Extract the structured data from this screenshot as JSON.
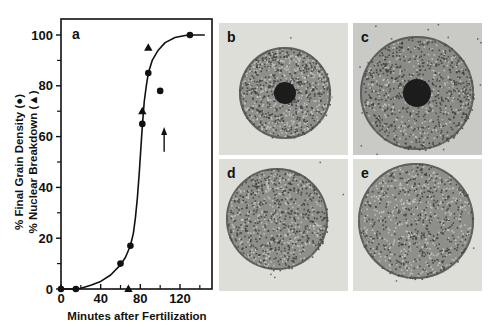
{
  "chart_data": {
    "type": "scatter",
    "panel_label": "a",
    "title": "",
    "xlabel": "Minutes after Fertilization",
    "ylabel_lines": [
      "% Final Grain Density (●)",
      "% Nuclear Breakdown (▲)"
    ],
    "xlim": [
      0,
      145
    ],
    "ylim": [
      0,
      100
    ],
    "xticks": [
      0,
      40,
      80,
      120
    ],
    "xtick_minor": [
      20,
      60,
      100,
      140
    ],
    "yticks": [
      0,
      20,
      40,
      60,
      80,
      100
    ],
    "ytick_minor": [
      10,
      30,
      50,
      70,
      90
    ],
    "grid": false,
    "series": [
      {
        "name": "% Final Grain Density",
        "marker": "circle",
        "points": [
          [
            0,
            0
          ],
          [
            15,
            0
          ],
          [
            60,
            10
          ],
          [
            70,
            17
          ],
          [
            82,
            65
          ],
          [
            88,
            85
          ],
          [
            100,
            78
          ],
          [
            130,
            100
          ]
        ]
      },
      {
        "name": "% Nuclear Breakdown",
        "marker": "triangle",
        "points": [
          [
            68,
            0
          ],
          [
            82,
            70
          ],
          [
            88,
            95
          ]
        ]
      }
    ],
    "fit_curve": {
      "type": "sigmoid",
      "points": [
        [
          15,
          0
        ],
        [
          20,
          0.3
        ],
        [
          30,
          1.5
        ],
        [
          40,
          3
        ],
        [
          50,
          5.5
        ],
        [
          60,
          9.5
        ],
        [
          65,
          12.5
        ],
        [
          70,
          17
        ],
        [
          73,
          22
        ],
        [
          75,
          28
        ],
        [
          77,
          36
        ],
        [
          79,
          46
        ],
        [
          80,
          52
        ],
        [
          82,
          64
        ],
        [
          84,
          74
        ],
        [
          86,
          80
        ],
        [
          88,
          85
        ],
        [
          92,
          90
        ],
        [
          98,
          94
        ],
        [
          105,
          97
        ],
        [
          115,
          99
        ],
        [
          125,
          99.8
        ],
        [
          130,
          100
        ],
        [
          145,
          100
        ]
      ]
    },
    "annotations": [
      {
        "type": "arrow",
        "direction": "up",
        "x": 104,
        "y_from": 54,
        "y_to": 63
      }
    ]
  },
  "micrographs": [
    {
      "label": "b",
      "description": "round cell with dark central nucleus"
    },
    {
      "label": "c",
      "description": "larger grainy cell with dark central nucleus"
    },
    {
      "label": "d",
      "description": "round cell, nucleus broken down"
    },
    {
      "label": "e",
      "description": "round cell, uniformly grainy"
    }
  ],
  "colors": {
    "ink": "#111111",
    "paper": "#ffffff",
    "panel_bg": "#dcdcd8",
    "cell": "#7a7a76"
  }
}
